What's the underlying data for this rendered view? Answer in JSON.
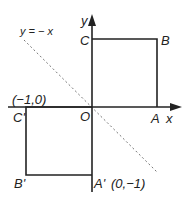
{
  "diagram": {
    "colors": {
      "line": "#222222",
      "dashed": "#777777",
      "text": "#222222",
      "background": "#ffffff"
    },
    "axes": {
      "x_label": "x",
      "y_label": "y",
      "origin_label": "O"
    },
    "mirror_line": {
      "label": "y = − x",
      "style": "dashed"
    },
    "square_original": {
      "vertices": [
        {
          "name": "O",
          "label": "O"
        },
        {
          "name": "A",
          "label": "A"
        },
        {
          "name": "B",
          "label": "B"
        },
        {
          "name": "C",
          "label": "C"
        }
      ]
    },
    "square_image": {
      "vertices": [
        {
          "name": "C'",
          "label": "C'",
          "coord": "(−1,0)"
        },
        {
          "name": "B'",
          "label": "B'"
        },
        {
          "name": "A'",
          "label": "A'",
          "coord": "(0,−1)"
        }
      ]
    },
    "annotations": {
      "c_prime_coord": "(−1,0)",
      "a_prime_coord": "(0,−1)"
    }
  }
}
